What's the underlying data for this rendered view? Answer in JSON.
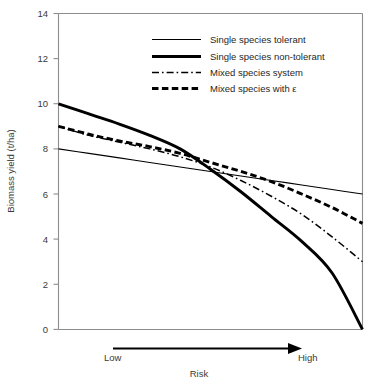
{
  "chart_data": {
    "type": "line",
    "title": "",
    "xlabel": "Risk",
    "ylabel": "Biomass yield (t/ha)",
    "ylim": [
      0,
      14
    ],
    "yticks": [
      0,
      2,
      4,
      6,
      8,
      10,
      12,
      14
    ],
    "ytick_labels": [
      "0",
      "2",
      "4",
      "6",
      "8",
      "10",
      "12",
      "14"
    ],
    "xlim": [
      0,
      1
    ],
    "xticks": [],
    "xtick_labels": [],
    "x_axis_endpoints": {
      "low": "Low",
      "high": "High"
    },
    "grid": false,
    "legend_position": "upper center",
    "x": [
      0.0,
      0.1,
      0.2,
      0.3,
      0.4,
      0.5,
      0.6,
      0.7,
      0.8,
      0.9,
      1.0
    ],
    "series": [
      {
        "name": "Single species tolerant",
        "style": "thin-solid",
        "values": [
          8.0,
          7.8,
          7.6,
          7.4,
          7.2,
          7.0,
          6.8,
          6.6,
          6.4,
          6.2,
          6.0
        ]
      },
      {
        "name": "Single species non-tolerant",
        "style": "thick-solid",
        "values": [
          10.0,
          9.55,
          9.1,
          8.6,
          8.0,
          7.1,
          6.1,
          5.0,
          3.9,
          2.5,
          0.0
        ]
      },
      {
        "name": "Mixed species system",
        "style": "dash-dot",
        "values": [
          9.0,
          8.6,
          8.3,
          8.0,
          7.65,
          7.2,
          6.6,
          5.9,
          5.1,
          4.1,
          3.0
        ]
      },
      {
        "name": "Mixed species with ε",
        "style": "thick-dashed",
        "values": [
          9.0,
          8.65,
          8.35,
          8.1,
          7.8,
          7.4,
          7.0,
          6.55,
          6.0,
          5.4,
          4.7
        ]
      }
    ],
    "annotations": [
      {
        "text": "Low",
        "role": "x-axis-start-label"
      },
      {
        "text": "High",
        "role": "x-axis-end-label"
      },
      {
        "text": "Risk",
        "role": "x-axis-title"
      }
    ],
    "colors": {
      "line": "#000000",
      "axis": "#8d8d8d",
      "text": "#1f1f1f",
      "background": "#ffffff"
    }
  },
  "legend": {
    "items": [
      {
        "label": "Single species tolerant"
      },
      {
        "label": "Single species non-tolerant"
      },
      {
        "label": "Mixed species system"
      },
      {
        "label": "Mixed species with ε"
      }
    ]
  },
  "axes": {
    "y_title": "Biomass yield (t/ha)",
    "x_title": "Risk",
    "y_tick_labels": [
      "14",
      "12",
      "10",
      "8",
      "6",
      "4",
      "2",
      "0"
    ],
    "x_low": "Low",
    "x_high": "High"
  }
}
